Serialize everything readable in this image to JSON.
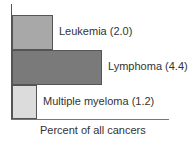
{
  "chart_data": {
    "type": "bar",
    "orientation": "horizontal",
    "title": "",
    "xlabel": "Percent of all cancers",
    "ylabel": "",
    "categories": [
      "Leukemia",
      "Lymphoma",
      "Multiple myeloma"
    ],
    "values": [
      2.0,
      4.4,
      1.2
    ],
    "labels": [
      "Leukemia (2.0)",
      "Lymphoma (4.4)",
      "Multiple myeloma (1.2)"
    ],
    "colors": [
      "#a8a8a8",
      "#7a7a7a",
      "#dcdcdc"
    ],
    "xlim": [
      0,
      5
    ],
    "grid": false,
    "legend": "none"
  }
}
